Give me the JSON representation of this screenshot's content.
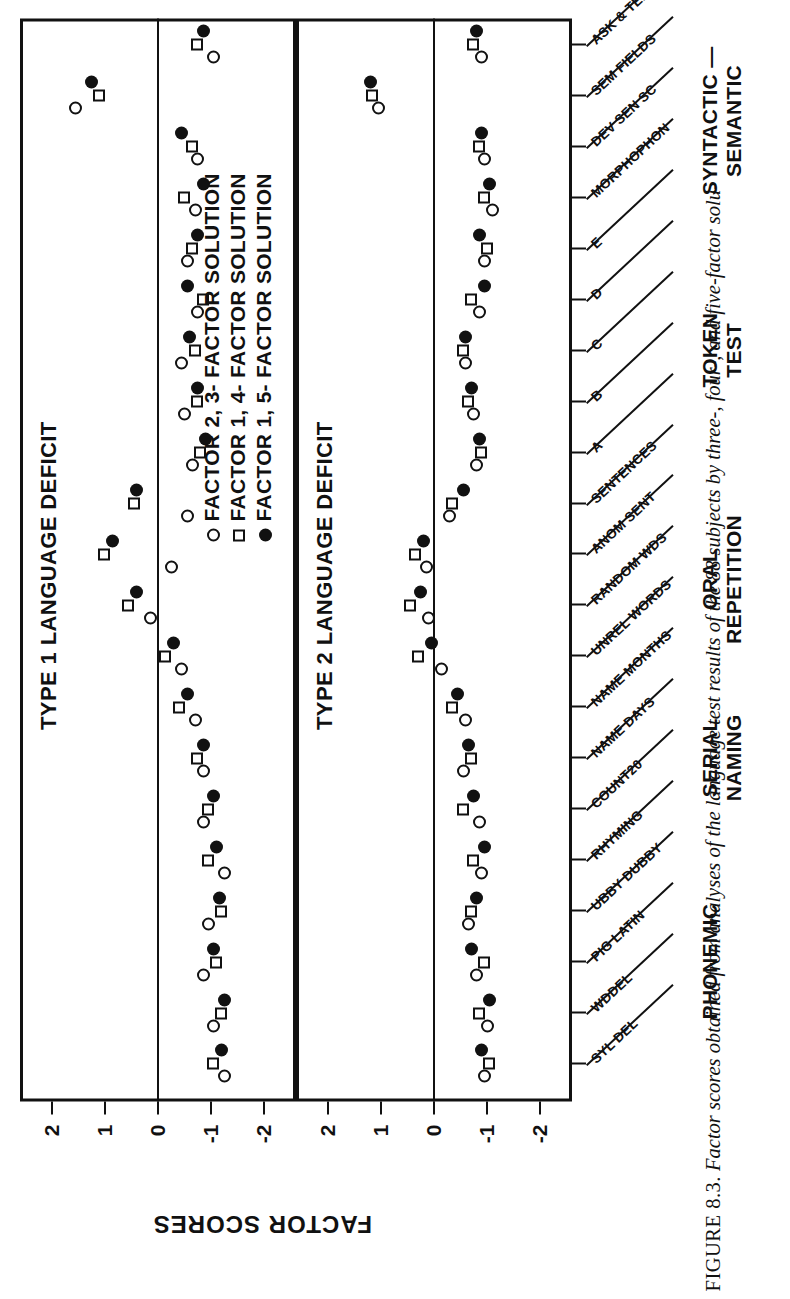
{
  "figure": {
    "number": "FIGURE 8.3.",
    "caption": "Factor scores obtained from analyses of the language test results of the 88 subjects by three-, four-, and five-factor solu-"
  },
  "axes": {
    "y_title": "FACTOR SCORES",
    "y_ticks": [
      "2",
      "1",
      "0",
      "-1",
      "-2"
    ],
    "y_values": [
      2,
      1,
      0,
      -1,
      -2
    ],
    "ylim": [
      -2.6,
      2.6
    ]
  },
  "panels": [
    {
      "id": "type1",
      "title": "TYPE 1 LANGUAGE DEFICIT"
    },
    {
      "id": "type2",
      "title": "TYPE 2 LANGUAGE DEFICIT"
    }
  ],
  "legends": [
    {
      "panel": "type1",
      "entries": [
        {
          "marker": "open-circle",
          "label": "FACTOR 1, 3- FACTOR SOLUTION"
        },
        {
          "marker": "square",
          "label": "FACTOR 2, 4- FACTOR SOLUTION"
        },
        {
          "marker": "filled-circle",
          "label": "FACTOR 2, 5- FACTOR SOLUTION"
        }
      ]
    },
    {
      "panel": "type2",
      "entries": [
        {
          "marker": "open-circle",
          "label": "FACTOR 2, 3- FACTOR SOLUTION"
        },
        {
          "marker": "square",
          "label": "FACTOR 1, 4- FACTOR SOLUTION"
        },
        {
          "marker": "filled-circle",
          "label": "FACTOR 1, 5- FACTOR SOLUTION"
        }
      ]
    }
  ],
  "x_groups": [
    {
      "name": "PHONEMIC",
      "line1": "PHONEMIC",
      "line2": ""
    },
    {
      "name": "SERIAL NAMING",
      "line1": "SERIAL",
      "line2": "NAMING"
    },
    {
      "name": "ORAL REPETITION",
      "line1": "ORAL",
      "line2": "REPETITION"
    },
    {
      "name": "TOKEN TEST",
      "line1": "TOKEN",
      "line2": "TEST"
    },
    {
      "name": "SYNTACTIC - SEMANTIC",
      "line1": "SYNTACTIC —",
      "line2": "SEMANTIC"
    }
  ],
  "x_tests": [
    {
      "label": "SYL DEL",
      "group": "PHONEMIC"
    },
    {
      "label": "WDDEL",
      "group": "PHONEMIC"
    },
    {
      "label": "PIG LATIN",
      "group": "PHONEMIC"
    },
    {
      "label": "UBBY DUBBY",
      "group": "PHONEMIC"
    },
    {
      "label": "RHYMING",
      "group": "PHONEMIC"
    },
    {
      "label": "COUNT20",
      "group": "SERIAL NAMING"
    },
    {
      "label": "NAME DAYS",
      "group": "SERIAL NAMING"
    },
    {
      "label": "NAME MONTHS",
      "group": "SERIAL NAMING"
    },
    {
      "label": "UNREL WORDS",
      "group": "ORAL REPETITION"
    },
    {
      "label": "RANDOM WDS",
      "group": "ORAL REPETITION"
    },
    {
      "label": "ANOM SENT",
      "group": "ORAL REPETITION"
    },
    {
      "label": "SENTENCES",
      "group": "ORAL REPETITION"
    },
    {
      "label": "A",
      "group": "TOKEN TEST"
    },
    {
      "label": "B",
      "group": "TOKEN TEST"
    },
    {
      "label": "C",
      "group": "TOKEN TEST"
    },
    {
      "label": "D",
      "group": "TOKEN TEST"
    },
    {
      "label": "E",
      "group": "TOKEN TEST"
    },
    {
      "label": "MORPHOPHON",
      "group": "SYNTACTIC - SEMANTIC"
    },
    {
      "label": "DEV SEN SC",
      "group": "SYNTACTIC - SEMANTIC"
    },
    {
      "label": "SEM FIELDS",
      "group": "SYNTACTIC - SEMANTIC"
    },
    {
      "label": "ASK & TELL",
      "group": "SYNTACTIC - SEMANTIC"
    }
  ],
  "chart_data": {
    "type": "scatter",
    "xlabel": "",
    "ylabel": "FACTOR SCORES",
    "ylim": [
      -2.6,
      2.6
    ],
    "grid": false,
    "legend_position": "above-right",
    "x": [
      "SYL DEL",
      "WDDEL",
      "PIG LATIN",
      "UBBY DUBBY",
      "RHYMING",
      "COUNT20",
      "NAME DAYS",
      "NAME MONTHS",
      "UNREL WORDS",
      "RANDOM WDS",
      "ANOM SENT",
      "SENTENCES",
      "A",
      "B",
      "C",
      "D",
      "E",
      "MORPHOPHON",
      "DEV SEN SC",
      "SEM FIELDS",
      "ASK & TELL"
    ],
    "panels": [
      {
        "panel": "TYPE 1 LANGUAGE DEFICIT",
        "series": [
          {
            "name": "FACTOR 1, 3- FACTOR SOLUTION",
            "marker": "open-circle",
            "values": [
              -1.25,
              -1.05,
              -0.85,
              -0.95,
              -1.25,
              -0.85,
              -0.85,
              -0.7,
              -0.45,
              0.15,
              -0.25,
              -0.55,
              -0.65,
              -0.5,
              -0.45,
              -0.75,
              -0.55,
              -0.7,
              -0.75,
              1.55,
              -1.05
            ]
          },
          {
            "name": "FACTOR 2, 4- FACTOR SOLUTION",
            "marker": "square",
            "values": [
              -1.05,
              -1.2,
              -1.1,
              -1.2,
              -0.95,
              -0.95,
              -0.75,
              -0.4,
              -0.15,
              0.55,
              1.0,
              0.45,
              -0.8,
              -0.75,
              -0.7,
              -0.85,
              -0.65,
              -0.5,
              -0.65,
              1.1,
              -0.75
            ]
          },
          {
            "name": "FACTOR 2, 5- FACTOR SOLUTION",
            "marker": "filled-circle",
            "values": [
              -1.2,
              -1.25,
              -1.05,
              -1.15,
              -1.1,
              -1.05,
              -0.85,
              -0.55,
              -0.3,
              0.4,
              0.85,
              0.4,
              -0.9,
              -0.75,
              -0.6,
              -0.55,
              -0.75,
              -0.85,
              -0.45,
              1.25,
              -0.85
            ]
          }
        ]
      },
      {
        "panel": "TYPE 2 LANGUAGE DEFICIT",
        "series": [
          {
            "name": "FACTOR 2, 3- FACTOR SOLUTION",
            "marker": "open-circle",
            "values": [
              -0.95,
              -1.0,
              -0.8,
              -0.65,
              -0.9,
              -0.85,
              -0.55,
              -0.6,
              -0.15,
              0.1,
              0.15,
              -0.3,
              -0.8,
              -0.75,
              -0.6,
              -0.85,
              -0.95,
              -1.1,
              -0.95,
              1.05,
              -0.9
            ]
          },
          {
            "name": "FACTOR 1, 4- FACTOR SOLUTION",
            "marker": "square",
            "values": [
              -1.05,
              -0.85,
              -0.95,
              -0.7,
              -0.75,
              -0.55,
              -0.7,
              -0.35,
              0.3,
              0.45,
              0.35,
              -0.35,
              -0.9,
              -0.65,
              -0.55,
              -0.7,
              -1.0,
              -0.95,
              -0.85,
              1.15,
              -0.75
            ]
          },
          {
            "name": "FACTOR 1, 5- FACTOR SOLUTION",
            "marker": "filled-circle",
            "values": [
              -0.9,
              -1.05,
              -0.7,
              -0.8,
              -0.95,
              -0.75,
              -0.65,
              -0.45,
              0.05,
              0.25,
              0.2,
              -0.55,
              -0.85,
              -0.7,
              -0.6,
              -0.95,
              -0.85,
              -1.05,
              -0.9,
              1.2,
              -0.8
            ]
          }
        ]
      }
    ]
  }
}
